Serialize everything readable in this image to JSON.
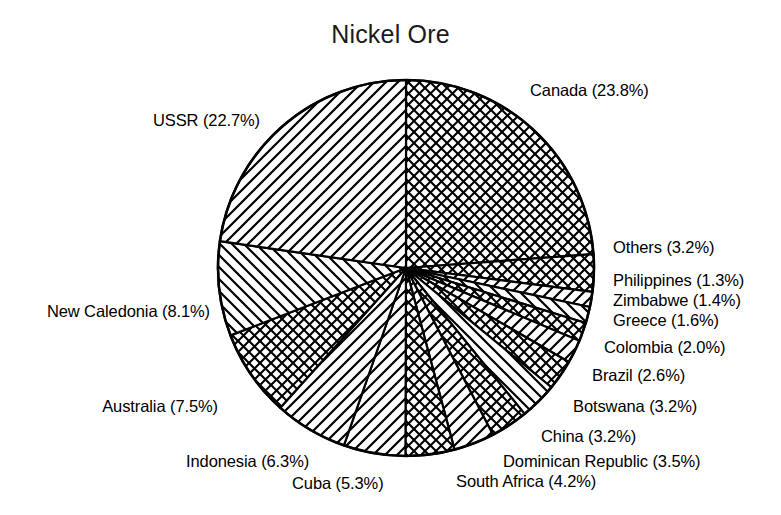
{
  "chart_data": {
    "type": "pie",
    "title": "Nickel Ore",
    "xlabel": "",
    "ylabel": "",
    "legend_position": "none",
    "grid": false,
    "unit": "percent",
    "start_angle_deg": 90,
    "direction": "clockwise",
    "categories": [
      "Canada",
      "Others",
      "Philippines",
      "Zimbabwe",
      "Greece",
      "Colombia",
      "Brazil",
      "Botswana",
      "China",
      "Dominican Republic",
      "South Africa",
      "Cuba",
      "Indonesia",
      "Australia",
      "New Caledonia",
      "USSR"
    ],
    "values": [
      23.8,
      3.2,
      1.3,
      1.4,
      1.6,
      2.0,
      2.6,
      3.2,
      3.2,
      3.5,
      4.2,
      5.3,
      6.3,
      7.5,
      8.1,
      22.7
    ],
    "slices": [
      {
        "label": "Canada (23.8%)",
        "name": "Canada",
        "value": 23.8,
        "pattern": "crosshatch"
      },
      {
        "label": "Others (3.2%)",
        "name": "Others",
        "value": 3.2,
        "pattern": "crosshatch"
      },
      {
        "label": "Philippines (1.3%)",
        "name": "Philippines",
        "value": 1.3,
        "pattern": "stripe-forward"
      },
      {
        "label": "Zimbabwe (1.4%)",
        "name": "Zimbabwe",
        "value": 1.4,
        "pattern": "stripe-back"
      },
      {
        "label": "Greece (1.6%)",
        "name": "Greece",
        "value": 1.6,
        "pattern": "crosshatch"
      },
      {
        "label": "Colombia (2.0%)",
        "name": "Colombia",
        "value": 2.0,
        "pattern": "stripe-forward"
      },
      {
        "label": "Brazil (2.6%)",
        "name": "Brazil",
        "value": 2.6,
        "pattern": "crosshatch"
      },
      {
        "label": "Botswana (3.2%)",
        "name": "Botswana",
        "value": 3.2,
        "pattern": "stripe-back"
      },
      {
        "label": "China (3.2%)",
        "name": "China",
        "value": 3.2,
        "pattern": "crosshatch"
      },
      {
        "label": "Dominican Republic (3.5%)",
        "name": "Dominican Republic",
        "value": 3.5,
        "pattern": "stripe-forward"
      },
      {
        "label": "South Africa (4.2%)",
        "name": "South Africa",
        "value": 4.2,
        "pattern": "crosshatch"
      },
      {
        "label": "Cuba (5.3%)",
        "name": "Cuba",
        "value": 5.3,
        "pattern": "stripe-forward"
      },
      {
        "label": "Indonesia (6.3%)",
        "name": "Indonesia",
        "value": 6.3,
        "pattern": "stripe-forward"
      },
      {
        "label": "Australia (7.5%)",
        "name": "Australia",
        "value": 7.5,
        "pattern": "crosshatch"
      },
      {
        "label": "New Caledonia (8.1%)",
        "name": "New Caledonia",
        "value": 8.1,
        "pattern": "stripe-back"
      },
      {
        "label": "USSR (22.7%)",
        "name": "USSR",
        "value": 22.7,
        "pattern": "stripe-forward"
      }
    ],
    "colors": {
      "fill": "#ffffff",
      "stroke": "#000000",
      "background": "#ffffff",
      "text": "#000000"
    }
  },
  "labels": {
    "canada": "Canada (23.8%)",
    "ussr": "USSR (22.7%)",
    "others": "Others (3.2%)",
    "philippines": "Philippines (1.3%)",
    "zimbabwe": "Zimbabwe (1.4%)",
    "greece": "Greece (1.6%)",
    "colombia": "Colombia (2.0%)",
    "brazil": "Brazil (2.6%)",
    "botswana": "Botswana (3.2%)",
    "china": "China (3.2%)",
    "dominican_republic": "Dominican Republic (3.5%)",
    "south_africa": "South Africa (4.2%)",
    "cuba": "Cuba (5.3%)",
    "indonesia": "Indonesia (6.3%)",
    "australia": "Australia (7.5%)",
    "new_caledonia": "New Caledonia (8.1%)"
  }
}
